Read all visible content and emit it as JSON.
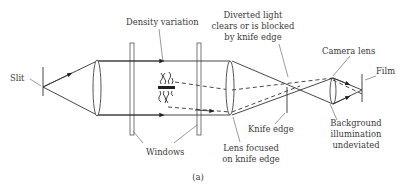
{
  "diagram": {
    "type": "schlieren-optical-setup",
    "caption": "(a)",
    "labels": {
      "slit": "Slit",
      "density_variation": "Density variation",
      "windows": "Windows",
      "diverted_light": [
        "Diverted light",
        "clears or is blocked",
        "by knife edge"
      ],
      "camera_lens": "Camera lens",
      "film": "Film",
      "lens_focused": [
        "Lens focused",
        "on knife edge"
      ],
      "knife_edge": "Knife edge",
      "background": [
        "Background",
        "illumination",
        "undeviated"
      ]
    },
    "components": [
      "slit-icon",
      "collimating-lens-icon",
      "window-icon",
      "density-variation-icon",
      "focusing-lens-icon",
      "knife-edge-icon",
      "camera-lens-icon",
      "film-icon"
    ]
  }
}
